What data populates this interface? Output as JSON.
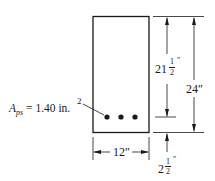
{
  "diagram": {
    "section": {
      "width_label": "12″",
      "height_label": "24″"
    },
    "depth": {
      "whole": "21",
      "num": "1",
      "den": "2",
      "unit": "″"
    },
    "cover": {
      "whole": "2",
      "num": "1",
      "den": "2",
      "unit": "″"
    },
    "steel": {
      "label_main": "A",
      "label_sub": "ps",
      "label_value": " = 1.40 in.",
      "label_exp": "2",
      "tendon_count": 3
    }
  }
}
